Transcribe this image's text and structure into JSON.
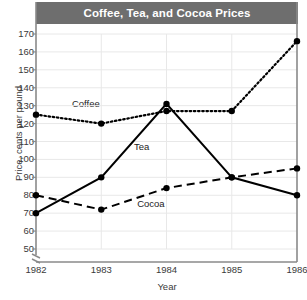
{
  "chart_data": {
    "type": "line",
    "title": "Coffee, Tea, and Cocoa Prices",
    "xlabel": "Year",
    "ylabel": "Price, cents per pound",
    "categories": [
      "1982",
      "1983",
      "1984",
      "1985",
      "1986"
    ],
    "x": [
      1982,
      1983,
      1984,
      1985,
      1986
    ],
    "ylim": [
      50,
      170
    ],
    "y_ticks": [
      "50",
      "60",
      "70",
      "80",
      "90",
      "100",
      "110",
      "120",
      "130",
      "140",
      "150",
      "160",
      "170"
    ],
    "y_tick_values": [
      50,
      60,
      70,
      80,
      90,
      100,
      110,
      120,
      130,
      140,
      150,
      160,
      170
    ],
    "x_ticks": [
      "1982",
      "1983",
      "1984",
      "1985",
      "1986"
    ],
    "grid": true,
    "grid_axis": "y",
    "axis_break": true,
    "axis_break_note": "y-axis broken below 50",
    "legend": "inline-labels",
    "series": [
      {
        "name": "Coffee",
        "style": "dotted",
        "values": [
          125,
          120,
          127,
          127,
          166
        ],
        "label_x": 1982.55,
        "label_y": 131
      },
      {
        "name": "Tea",
        "style": "solid",
        "values": [
          70,
          90,
          131,
          90,
          80
        ],
        "label_x": 1983.5,
        "label_y": 107
      },
      {
        "name": "Cocoa",
        "style": "dashed",
        "values": [
          80,
          72,
          84,
          90,
          95
        ],
        "label_x": 1983.55,
        "label_y": 75
      }
    ]
  },
  "style": {
    "title_banner_bg": "#6e6e6e",
    "title_text_color": "#ffffff",
    "line_color": "#000000",
    "axis_color": "#8a8a8a",
    "grid_color": "#e8e8e8",
    "tick_text_color": "#3a3a3a",
    "background": "#ffffff"
  }
}
